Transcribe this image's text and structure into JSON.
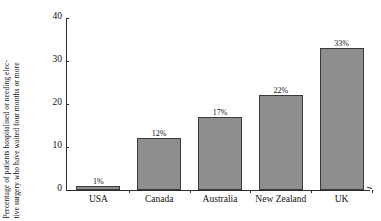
{
  "chart_data": {
    "type": "bar",
    "title": "",
    "subtitle": "",
    "xlabel": "",
    "ylabel_line_1": "Percentage of patients hospitalised or needing elec-",
    "ylabel_line_2": "tive surgery who have waited four months or more",
    "categories": [
      "USA",
      "Canada",
      "Australia",
      "New Zealand",
      "UK"
    ],
    "values": [
      1,
      12,
      17,
      22,
      33
    ],
    "data_labels": [
      "1%",
      "12%",
      "17%",
      "22%",
      "33%"
    ],
    "ylim": [
      0,
      40
    ],
    "yticks": [
      0,
      10,
      20,
      30,
      40
    ],
    "ytick_labels": [
      "0",
      "10",
      "20",
      "30",
      "40"
    ],
    "grid": false,
    "legend": false,
    "legend_position": "none",
    "bar_fill_color": "#8e8e8e",
    "bar_edge_color": "#3a3a3a",
    "axis_color": "#2b2b2b",
    "text_color": "#111111",
    "background_color": "#ffffff"
  }
}
